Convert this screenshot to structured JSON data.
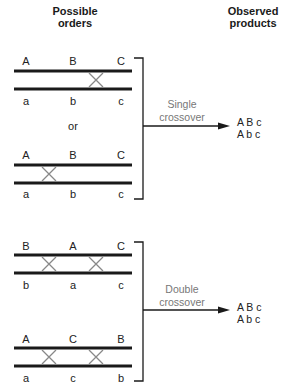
{
  "headers": {
    "left": [
      "Possible",
      "orders"
    ],
    "right": [
      "Observed",
      "products"
    ]
  },
  "groups": [
    {
      "top": [
        "A",
        "B",
        "C"
      ],
      "bottom": [
        "a",
        "b",
        "c"
      ],
      "crossovers": 1
    },
    {
      "top": [
        "A",
        "B",
        "C"
      ],
      "bottom": [
        "a",
        "b",
        "c"
      ],
      "crossovers": 1
    },
    {
      "top": [
        "B",
        "A",
        "C"
      ],
      "bottom": [
        "b",
        "a",
        "c"
      ],
      "crossovers": 2
    },
    {
      "top": [
        "A",
        "C",
        "B"
      ],
      "bottom": [
        "a",
        "c",
        "b"
      ],
      "crossovers": 2
    }
  ],
  "separator": "or",
  "outcomes": [
    {
      "label": [
        "Single",
        "crossover"
      ],
      "products": [
        "A B c",
        "A b c"
      ]
    },
    {
      "label": [
        "Double",
        "crossover"
      ],
      "products": [
        "A B c",
        "A b c"
      ]
    }
  ],
  "colors": {
    "line": "#1a1a1a",
    "cross": "#888888",
    "note": "#777777"
  }
}
